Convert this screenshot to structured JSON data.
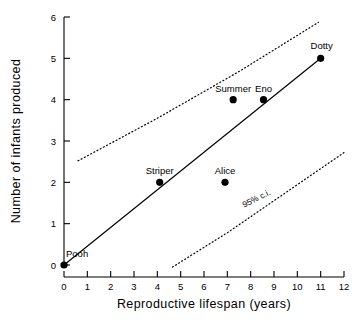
{
  "chart_data": {
    "type": "scatter",
    "title": "",
    "xlabel": "Reproductive lifespan (years)",
    "ylabel": "Number of infants produced",
    "xlim": [
      0,
      12
    ],
    "ylim": [
      0,
      6
    ],
    "xticks": [
      "0",
      "1",
      "2",
      "3",
      "4",
      "5",
      "6",
      "7",
      "8",
      "9",
      "10",
      "11",
      "12"
    ],
    "yticks": [
      "0",
      "1",
      "2",
      "3",
      "4",
      "5",
      "6"
    ],
    "grid": false,
    "legend": "none",
    "points": [
      {
        "label": "Pooh",
        "x": 0.0,
        "y": 0
      },
      {
        "label": "Striper",
        "x": 4.1,
        "y": 2
      },
      {
        "label": "Alice",
        "x": 6.9,
        "y": 2
      },
      {
        "label": "Summer",
        "x": 7.25,
        "y": 4
      },
      {
        "label": "Eno",
        "x": 8.55,
        "y": 4
      },
      {
        "label": "Dotty",
        "x": 11.0,
        "y": 5
      }
    ],
    "series": [
      {
        "name": "regression line",
        "style": "solid",
        "x": [
          0.0,
          11.0
        ],
        "y": [
          0.0,
          5.0
        ]
      },
      {
        "name": "95% c.i. upper",
        "style": "dotted",
        "x": [
          0.6,
          4.0,
          7.5,
          10.9
        ],
        "y": [
          2.52,
          3.55,
          4.68,
          5.87
        ]
      },
      {
        "name": "95% c.i. lower",
        "style": "dotted",
        "x": [
          4.65,
          7.0,
          9.5,
          12.0
        ],
        "y": [
          -0.05,
          0.78,
          1.75,
          2.72
        ]
      }
    ],
    "annotations": [
      {
        "text": "95% c.i.",
        "x": 8.3,
        "y": 1.55,
        "rotation": -27
      }
    ],
    "colors": {
      "axis": "#000000",
      "point": "#000000",
      "fit_line": "#000000",
      "ci_line": "#000000",
      "background": "#ffffff"
    }
  }
}
